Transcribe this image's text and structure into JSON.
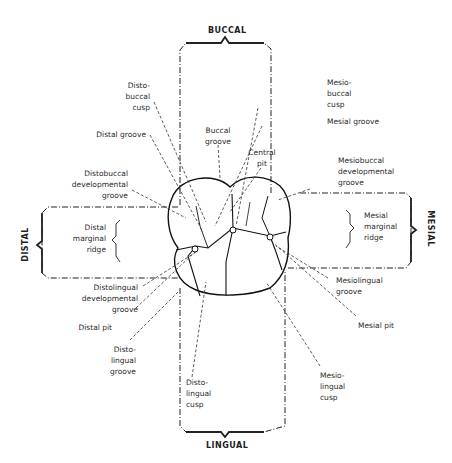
{
  "directions": {
    "buccal": "BUCCAL",
    "lingual": "LINGUAL",
    "distal": "DISTAL",
    "mesial": "MESIAL"
  },
  "labels": {
    "disto_buccal_cusp": "Disto-\nbuccal\ncusp",
    "distal_groove": "Distal groove",
    "buccal_groove": "Buccal\ngroove",
    "central_pit": "Central\npit",
    "mesio_buccal_cusp": "Mesio-\nbuccal\ncusp",
    "mesial_groove": "Mesial groove",
    "distobuccal_developmental_groove": "Distobuccal\ndevelopmental\ngroove",
    "mesiobuccal_developmental_groove": "Mesiobuccal\ndevelopmental\ngroove",
    "distal_marginal_ridge": "Distal\nmarginal\nridge",
    "mesial_marginal_ridge": "Mesial\nmarginal\nridge",
    "distolingual_developmental_groove": "Distolingual\ndevelopmental\ngroove",
    "distal_pit": "Distal pit",
    "disto_lingual_groove": "Disto-\nlingual\ngroove",
    "disto_lingual_cusp": "Disto-\nlingual\ncusp",
    "mesiolingual_groove": "Mesiolingual\ngroove",
    "mesial_pit": "Mesial pit",
    "mesio_lingual_cusp": "Mesio-\nlingual\ncusp"
  }
}
